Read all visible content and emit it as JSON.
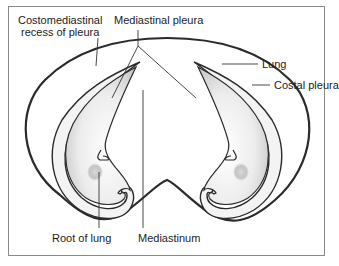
{
  "diagram": {
    "type": "anatomical cross-section",
    "labels": {
      "costomediastinal_recess_line1": "Costomediastinal",
      "costomediastinal_recess_line2": "recess of pleura",
      "mediastinal_pleura": "Mediastinal pleura",
      "lung": "Lung",
      "costal_pleura": "Costal pleura",
      "root_of_lung": "Root of lung",
      "mediastinum": "Mediastinum"
    },
    "colors": {
      "outline": "#2a2a2a",
      "pleura_fill": "#f2f2f2",
      "lung_shade": "#c8c8c8",
      "frame": "#8a8a8a",
      "text": "#222222"
    }
  }
}
